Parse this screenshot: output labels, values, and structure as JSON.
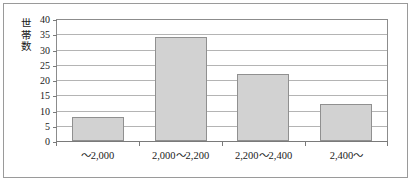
{
  "chart_data": {
    "type": "bar",
    "title": "",
    "xlabel": "",
    "ylabel": "世帯数",
    "categories": [
      "～2,000",
      "2,000～2,200",
      "2,200～2,400",
      "2,400～"
    ],
    "values": [
      8,
      34,
      22,
      12
    ],
    "ylim": [
      0,
      40
    ],
    "ytick_step": 5,
    "ytick_labels": [
      "40",
      "35",
      "30",
      "25",
      "20",
      "15",
      "10",
      "5",
      "0"
    ],
    "grid": true,
    "legend": "none",
    "colors": {
      "bar_fill": "#d2d2d2",
      "bar_stroke": "#909090",
      "gridline": "#b4b4b4",
      "axis": "#7a7a7a",
      "frame": "#9a9a9a",
      "text": "#1a1a1a"
    }
  },
  "axis": {
    "y_title_chars": "世\n帯\n数"
  }
}
